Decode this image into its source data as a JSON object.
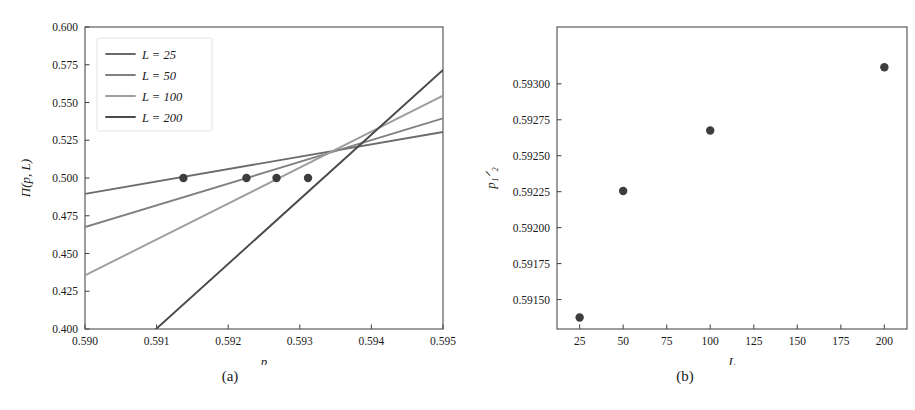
{
  "figure": {
    "panels": [
      {
        "id": "a",
        "caption": "(a)"
      },
      {
        "id": "b",
        "caption": "(b)"
      }
    ]
  },
  "panel_a": {
    "caption": "(a)",
    "xlabel": "p",
    "ylabel": "Π(p, L)",
    "legend": {
      "entries": [
        {
          "label": "L = 25",
          "color": "#6b6b6b"
        },
        {
          "label": "L = 50",
          "color": "#808080"
        },
        {
          "label": "L = 100",
          "color": "#9e9e9e"
        },
        {
          "label": "L = 200",
          "color": "#4a4a4a"
        }
      ]
    },
    "xticks": [
      "0.590",
      "0.591",
      "0.592",
      "0.593",
      "0.594",
      "0.595"
    ],
    "yticks": [
      "0.400",
      "0.425",
      "0.450",
      "0.475",
      "0.500",
      "0.525",
      "0.550",
      "0.575",
      "0.600"
    ]
  },
  "panel_b": {
    "caption": "(b)",
    "xlabel": "L",
    "ylabel": "p₁ᐟ₂",
    "xticks": [
      "25",
      "50",
      "75",
      "100",
      "125",
      "150",
      "175",
      "200"
    ],
    "yticks": [
      "0.59150",
      "0.59175",
      "0.59200",
      "0.59225",
      "0.59250",
      "0.59275",
      "0.59300"
    ]
  },
  "chart_data": [
    {
      "type": "line",
      "panel": "(a)",
      "title": "",
      "xlabel": "p",
      "ylabel": "Π(p, L)",
      "xlim": [
        0.59,
        0.595
      ],
      "ylim": [
        0.4,
        0.6
      ],
      "xticks": [
        0.59,
        0.591,
        0.592,
        0.593,
        0.594,
        0.595
      ],
      "yticks": [
        0.4,
        0.425,
        0.45,
        0.475,
        0.5,
        0.525,
        0.55,
        0.575,
        0.6
      ],
      "grid": false,
      "legend_position": "upper left",
      "series": [
        {
          "name": "L = 25",
          "color": "#6b6b6b",
          "x": [
            0.59,
            0.595
          ],
          "y": [
            0.4895,
            0.5305
          ],
          "marker_point": {
            "x": 0.591375,
            "y": 0.5
          }
        },
        {
          "name": "L = 50",
          "color": "#808080",
          "x": [
            0.59,
            0.595
          ],
          "y": [
            0.4675,
            0.5395
          ],
          "marker_point": {
            "x": 0.592255,
            "y": 0.5
          }
        },
        {
          "name": "L = 100",
          "color": "#9e9e9e",
          "x": [
            0.59,
            0.595
          ],
          "y": [
            0.4355,
            0.5545
          ],
          "marker_point": {
            "x": 0.592675,
            "y": 0.5
          }
        },
        {
          "name": "L = 200",
          "color": "#4a4a4a",
          "x": [
            0.59,
            0.595
          ],
          "y": [
            0.3575,
            0.5715
          ],
          "marker_point": {
            "x": 0.593115,
            "y": 0.5
          }
        }
      ],
      "marker_color": "#3d3d3d",
      "annotation": "Curves for all L cross near p ≈ 0.5937 at Π ≈ 0.5215"
    },
    {
      "type": "scatter",
      "panel": "(b)",
      "title": "",
      "xlabel": "L",
      "ylabel": "p₁ᐟ₂",
      "xlim": [
        12,
        213
      ],
      "ylim": [
        0.591295,
        0.593395
      ],
      "xticks": [
        25,
        50,
        75,
        100,
        125,
        150,
        175,
        200
      ],
      "yticks": [
        0.5915,
        0.59175,
        0.592,
        0.59225,
        0.5925,
        0.59275,
        0.593
      ],
      "grid": false,
      "marker_color": "#3d3d3d",
      "x": [
        25,
        50,
        100,
        200
      ],
      "y": [
        0.591375,
        0.592255,
        0.592675,
        0.593115
      ]
    }
  ]
}
